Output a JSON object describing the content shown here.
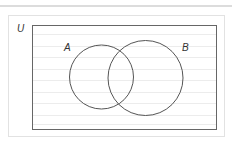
{
  "diagram": {
    "type": "venn",
    "universal_label": "U",
    "sets": [
      {
        "id": "A",
        "label": "A",
        "cx": 101.5,
        "cy": 77,
        "r": 32
      },
      {
        "id": "B",
        "label": "B",
        "cx": 145.5,
        "cy": 78,
        "r": 37.5
      }
    ],
    "colors": {
      "outline": "#555555",
      "ruled_lines": "#ececec",
      "frame": "#e2e2e2",
      "top_rule": "#dcdcdc"
    }
  }
}
